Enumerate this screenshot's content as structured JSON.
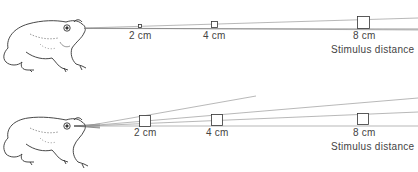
{
  "panels": [
    {
      "id": "top",
      "description": "Constant-size stimulus: image shrinks on retina as distance increases",
      "stimuli": [
        {
          "label": "2 cm",
          "size": "tiny"
        },
        {
          "label": "4 cm",
          "size": "small"
        },
        {
          "label": "8 cm",
          "size": "large"
        }
      ],
      "axis_label": "Stimulus distance"
    },
    {
      "id": "bottom",
      "description": "Same-angle stimuli: constant visual angle at each distance",
      "stimuli": [
        {
          "label": "2 cm",
          "size": "equal"
        },
        {
          "label": "4 cm",
          "size": "equal"
        },
        {
          "label": "8 cm",
          "size": "equal"
        }
      ],
      "axis_label": "Stimulus distance"
    }
  ],
  "colors": {
    "line": "#9a9a9a",
    "square": "#333333",
    "text": "#444444",
    "frog_outline": "#333333"
  }
}
